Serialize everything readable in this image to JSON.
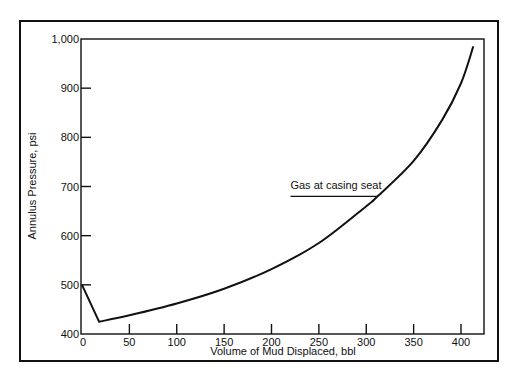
{
  "chart_data": {
    "type": "line",
    "title": "",
    "xlabel": "Volume of Mud Displaced, bbl",
    "ylabel": "Annulus Pressure, psi",
    "xlim": [
      0,
      425
    ],
    "ylim": [
      400,
      1000
    ],
    "grid": false,
    "legend": null,
    "x_ticks": [
      0,
      50,
      100,
      150,
      200,
      250,
      300,
      350,
      400
    ],
    "x_tick_labels": [
      "0",
      "50",
      "100",
      "150",
      "200",
      "250",
      "300",
      "350",
      "400"
    ],
    "y_ticks": [
      400,
      500,
      600,
      700,
      800,
      900,
      1000
    ],
    "y_tick_labels": [
      "400",
      "500",
      "600",
      "700",
      "800",
      "900",
      "1,000"
    ],
    "series": [
      {
        "name": "Annulus Pressure",
        "x": [
          0,
          18,
          50,
          100,
          150,
          200,
          250,
          300,
          312,
          350,
          380,
          400,
          413
        ],
        "y": [
          500,
          425,
          438,
          462,
          492,
          532,
          585,
          660,
          680,
          752,
          835,
          910,
          985
        ]
      }
    ],
    "annotations": [
      {
        "text": "Gas at casing seat",
        "x": 312,
        "y": 680,
        "leader_from_x": 220
      }
    ]
  }
}
